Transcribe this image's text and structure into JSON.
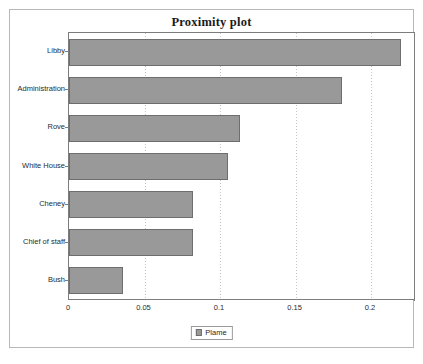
{
  "window": {
    "title": "Proximity plot"
  },
  "legend": {
    "swatch_name": "plame-series-swatch",
    "label": "Plame",
    "position": "bottom-center"
  },
  "colors": {
    "bar_fill": "#999999",
    "bar_border": "#6e6e6e",
    "axis": "#7d7d7d",
    "gridline": "#c4c4c4",
    "frame": "#b8b8b8",
    "text": "#2a2a2a"
  },
  "chart_data": {
    "type": "bar",
    "orientation": "horizontal",
    "title": "Proximity plot",
    "xlabel": "",
    "ylabel": "",
    "categories": [
      "Libby",
      "Administration",
      "Rove",
      "White House",
      "Cheney",
      "Chief of staff",
      "Bush"
    ],
    "values": [
      0.22,
      0.181,
      0.113,
      0.105,
      0.082,
      0.082,
      0.036
    ],
    "series": [
      {
        "name": "Plame",
        "values": [
          0.22,
          0.181,
          0.113,
          0.105,
          0.082,
          0.082,
          0.036
        ]
      }
    ],
    "xlim": [
      0,
      0.2291
    ],
    "xticks": [
      0,
      0.05,
      0.1,
      0.15,
      0.2
    ],
    "xticklabels": [
      "0",
      "0.05",
      "0.1",
      "0.15",
      "0.2"
    ],
    "grid": "vertical-dotted",
    "legend_position": "bottom-center"
  }
}
